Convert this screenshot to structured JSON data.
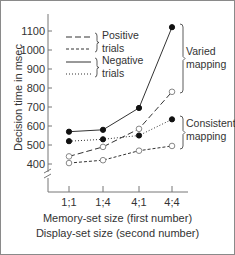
{
  "chart_data": {
    "type": "line",
    "title": "",
    "xlabel": "Memory-set size (first number)\nDisplay-set size (second number)",
    "xlabel_lines": [
      "Memory-set size (first number)",
      "Display-set size (second number)"
    ],
    "ylabel": "Decision time in msec",
    "categories": [
      "1;1",
      "1;4",
      "4;1",
      "4;4"
    ],
    "yticks": [
      400,
      500,
      600,
      700,
      800,
      900,
      1000,
      1100
    ],
    "ylim": [
      350,
      1150
    ],
    "y_axis_break": true,
    "grid": false,
    "legend": [
      {
        "group": "Positive trials",
        "entries": [
          "Positive varied (long dash)",
          "Positive consistent (short dash)"
        ]
      },
      {
        "group": "Negative trials",
        "entries": [
          "Negative varied (solid)",
          "Negative consistent (dotted)"
        ]
      }
    ],
    "legend_labels": {
      "positive": [
        "Positive",
        "trials"
      ],
      "negative": [
        "Negative",
        "trials"
      ]
    },
    "annotations": [
      {
        "text": [
          "Varied",
          "mapping"
        ],
        "applies_to": [
          "Negative varied",
          "Positive varied"
        ]
      },
      {
        "text": [
          "Consistent",
          "mapping"
        ],
        "applies_to": [
          "Negative consistent",
          "Positive consistent"
        ]
      }
    ],
    "series": [
      {
        "name": "Negative varied",
        "style": "solid",
        "marker": "filled",
        "values": [
          570,
          580,
          695,
          1120
        ]
      },
      {
        "name": "Negative consistent",
        "style": "dotted",
        "marker": "filled",
        "values": [
          520,
          530,
          550,
          635
        ]
      },
      {
        "name": "Positive varied",
        "style": "long-dash",
        "marker": "open",
        "values": [
          440,
          490,
          585,
          780
        ]
      },
      {
        "name": "Positive consistent",
        "style": "short-dash",
        "marker": "open",
        "values": [
          405,
          420,
          470,
          495
        ]
      }
    ]
  },
  "colors": {
    "line": "#333333",
    "axis": "#777777",
    "text": "#333333",
    "border": "#8a8a8a"
  }
}
